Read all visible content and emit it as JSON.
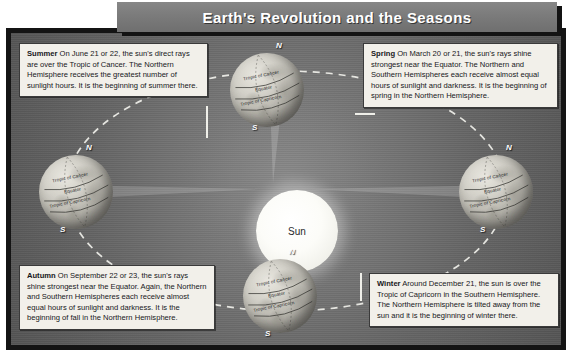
{
  "title": "Earth's Revolution and the Seasons",
  "sun": {
    "label": "Sun"
  },
  "globe_labels": {
    "tropic_of_cancer": "Tropic of Cancer",
    "equator": "Equator",
    "tropic_of_capricorn": "Tropic of Capricorn",
    "north_pole": "N",
    "south_pole": "S"
  },
  "callouts": {
    "summer": {
      "heading": "Summer",
      "body": " On June 21 or 22, the sun's direct rays are over the Tropic of Cancer. The Northern Hemisphere receives the greatest number of sunlight hours. It is the beginning of summer there."
    },
    "spring": {
      "heading": "Spring",
      "body": " On March 20 or 21, the sun's rays shine strongest near the Equator. The Northern and Southern Hemispheres each receive almost equal hours of sunlight and darkness. It is the beginning of spring in the Northern Hemisphere."
    },
    "autumn": {
      "heading": "Autumn",
      "body": " On September 22 or 23, the sun's rays shine strongest near the Equator. Again, the Northern and Southern Hemispheres each receive almost equal hours of sunlight and darkness. It is the beginning of fall in the Northern Hemisphere."
    },
    "winter": {
      "heading": "Winter",
      "body": " Around December 21, the sun is over the Tropic of Capricorn in the Southern Hemisphere. The Northern Hemisphere is tilted away from the sun and it is the beginning of winter there."
    }
  },
  "positions": {
    "top_globe": "summer",
    "right_globe": "spring",
    "bottom_globe": "winter",
    "left_globe": "autumn"
  },
  "colors": {
    "background": "#6e6e6e",
    "frame_border": "#141414",
    "title_bar": "#7b7b7b",
    "title_text": "#ffffff",
    "callout_background": "#f2f0ea",
    "callout_text": "#17171a",
    "sun": "#ffffff",
    "orbit_dash": "#f0f0ea"
  }
}
